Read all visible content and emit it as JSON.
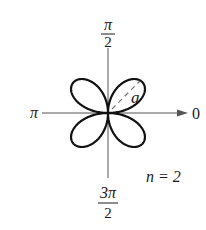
{
  "diagram": {
    "type": "polar-rose-curve",
    "equation_family": "r = a sin(nθ)",
    "petals": 4,
    "labels": {
      "top": {
        "num": "π",
        "den": "2"
      },
      "bottom": {
        "num": "3π",
        "den": "2"
      },
      "left": "π",
      "right": "0",
      "petal_length": "a",
      "n_label": "n = 2"
    },
    "colors": {
      "curve": "#111111",
      "axis": "#555555",
      "dashed": "#777777",
      "text": "#1a1a1a"
    }
  }
}
